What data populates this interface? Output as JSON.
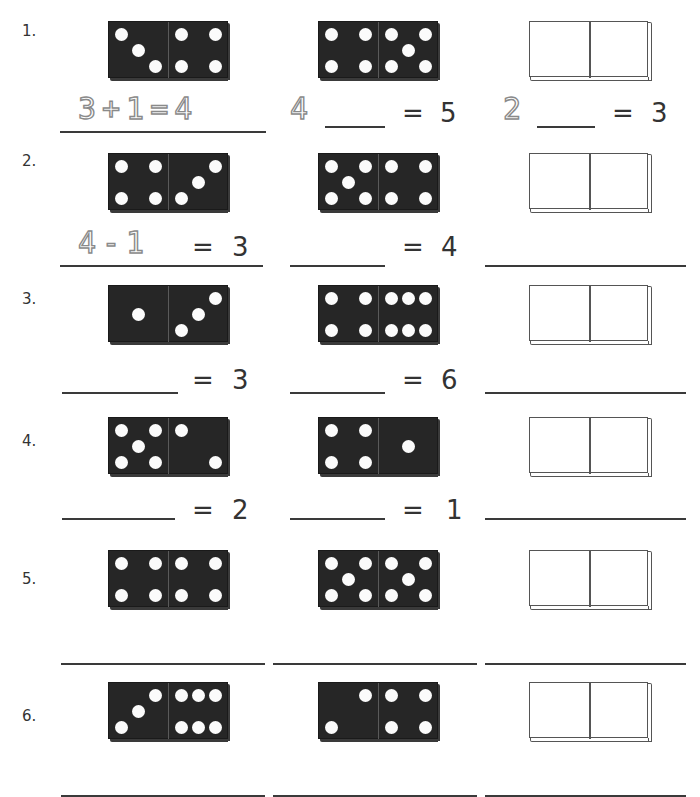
{
  "worksheet": {
    "rows": [
      {
        "label": "1.",
        "dominoes": [
          {
            "left": 3,
            "right": 4,
            "left_layout": "diag3",
            "right_layout": "four"
          },
          {
            "left": 4,
            "right": 5,
            "left_layout": "four",
            "right_layout": "five"
          }
        ],
        "equations": [
          {
            "traced": "3+1=4",
            "answer_line": true
          },
          {
            "traced_prefix": "4",
            "blank": true,
            "equals": "=",
            "result": "5"
          },
          {
            "traced_prefix": "2",
            "blank": true,
            "equals": "=",
            "result": "3"
          }
        ]
      },
      {
        "label": "2.",
        "dominoes": [
          {
            "left": 4,
            "right": 3,
            "left_layout": "four",
            "right_layout": "diag3"
          },
          {
            "left": 5,
            "right": 4,
            "left_layout": "five",
            "right_layout": "four"
          }
        ],
        "equations": [
          {
            "traced": "4-1",
            "equals": "=",
            "result": "3"
          },
          {
            "blank": true,
            "equals": "=",
            "result": "4"
          },
          {
            "blank": true
          }
        ]
      },
      {
        "label": "3.",
        "dominoes": [
          {
            "left": 1,
            "right": 3,
            "left_layout": "one",
            "right_layout": "diag3"
          },
          {
            "left": 4,
            "right": 6,
            "left_layout": "four",
            "right_layout": "six"
          }
        ],
        "equations": [
          {
            "blank": true,
            "equals": "=",
            "result": "3"
          },
          {
            "blank": true,
            "equals": "=",
            "result": "6"
          },
          {
            "blank": true
          }
        ]
      },
      {
        "label": "4.",
        "dominoes": [
          {
            "left": 5,
            "right": 2,
            "left_layout": "five",
            "right_layout": "two"
          },
          {
            "left": 4,
            "right": 1,
            "left_layout": "four",
            "right_layout": "one"
          }
        ],
        "equations": [
          {
            "blank": true,
            "equals": "=",
            "result": "2"
          },
          {
            "blank": true,
            "equals": "=",
            "result": "1"
          },
          {
            "blank": true
          }
        ]
      },
      {
        "label": "5.",
        "dominoes": [
          {
            "left": 4,
            "right": 4,
            "left_layout": "four",
            "right_layout": "four"
          },
          {
            "left": 5,
            "right": 5,
            "left_layout": "five",
            "right_layout": "five"
          }
        ],
        "equations": [
          {
            "blank": true
          },
          {
            "blank": true
          },
          {
            "blank": true
          }
        ]
      },
      {
        "label": "6.",
        "dominoes": [
          {
            "left": 3,
            "right": 6,
            "left_layout": "diag3",
            "right_layout": "six"
          },
          {
            "left": 2,
            "right": 4,
            "left_layout": "two",
            "right_layout": "four"
          }
        ],
        "equations": [
          {
            "blank": true
          },
          {
            "blank": true
          },
          {
            "blank": true
          }
        ]
      }
    ],
    "text": {
      "r1_traced": "3+1=4",
      "r1c2_prefix": "4",
      "r1c2_eq": "=",
      "r1c2_res": "5",
      "r1c3_prefix": "2",
      "r1c3_eq": "=",
      "r1c3_res": "3",
      "r2c1_traced": "4-1",
      "r2c1_eq": "=",
      "r2c1_res": "3",
      "r2c2_eq": "=",
      "r2c2_res": "4",
      "r3c1_eq": "=",
      "r3c1_res": "3",
      "r3c2_eq": "=",
      "r3c2_res": "6",
      "r4c1_eq": "=",
      "r4c1_res": "2",
      "r4c2_eq": "=",
      "r4c2_res": "1"
    },
    "colors": {
      "domino_fill": "#262626",
      "pip": "#fbfbfb",
      "ink": "#333333",
      "traced": "#8a8a8a"
    }
  }
}
